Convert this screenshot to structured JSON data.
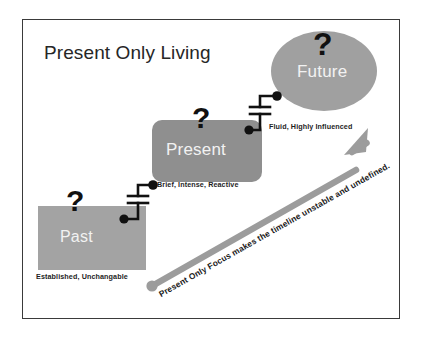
{
  "diagram": {
    "title": "Present Only Living",
    "background_color": "#ffffff",
    "frame_color": "#3a3a3a",
    "nodes": [
      {
        "id": "past",
        "label": "Past",
        "caption": "Established, Unchangable",
        "shape": "rectangle",
        "fill": "#a3a3a3",
        "question_mark": "?"
      },
      {
        "id": "present",
        "label": "Present",
        "caption": "Brief, Intense, Reactive",
        "shape": "rounded-rectangle",
        "fill": "#8f8f8f",
        "question_mark": "?"
      },
      {
        "id": "future",
        "label": "Future",
        "caption": "Fluid, Highly Influenced",
        "shape": "ellipse",
        "fill": "#a0a0a0",
        "question_mark": "?"
      }
    ],
    "connectors": [
      {
        "id": "past-to-present",
        "symbol": "capacitor"
      },
      {
        "id": "present-to-future",
        "symbol": "capacitor"
      }
    ],
    "arrow": {
      "label": "Present Only Focus makes the timeline unstable and undefined.",
      "color": "#9a9a9a",
      "direction": "up-right"
    }
  }
}
